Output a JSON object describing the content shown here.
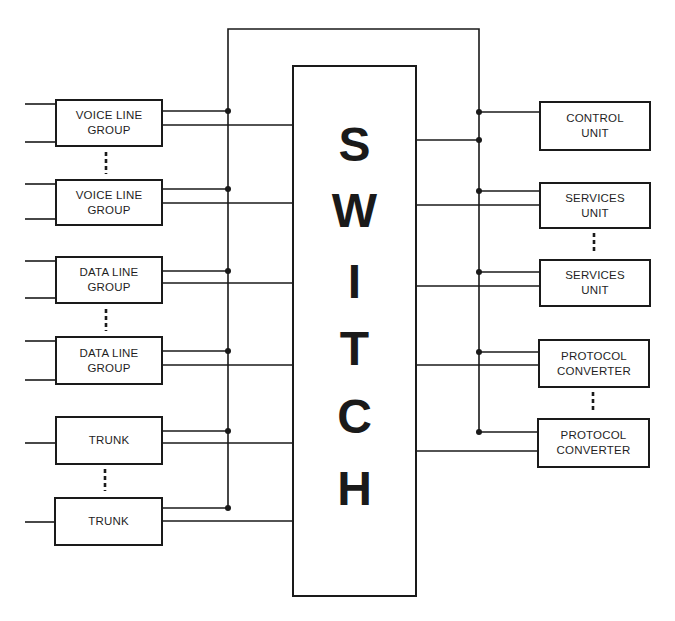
{
  "diagram": {
    "switch": {
      "label": "SWITCH",
      "letters": [
        "S",
        "W",
        "I",
        "T",
        "C",
        "H"
      ]
    },
    "left_blocks": [
      {
        "id": "voice-line-group-1",
        "label": "VOICE LINE\nGROUP"
      },
      {
        "id": "voice-line-group-2",
        "label": "VOICE LINE\nGROUP"
      },
      {
        "id": "data-line-group-1",
        "label": "DATA LINE\nGROUP"
      },
      {
        "id": "data-line-group-2",
        "label": "DATA LINE\nGROUP"
      },
      {
        "id": "trunk-1",
        "label": "TRUNK"
      },
      {
        "id": "trunk-2",
        "label": "TRUNK"
      }
    ],
    "right_blocks": [
      {
        "id": "control-unit",
        "label": "CONTROL\nUNIT"
      },
      {
        "id": "services-unit-1",
        "label": "SERVICES\nUNIT"
      },
      {
        "id": "services-unit-2",
        "label": "SERVICES\nUNIT"
      },
      {
        "id": "protocol-converter-1",
        "label": "PROTOCOL\nCONVERTER"
      },
      {
        "id": "protocol-converter-2",
        "label": "PROTOCOL\nCONVERTER"
      }
    ],
    "ellipsis_between": [
      [
        "voice-line-group-1",
        "voice-line-group-2"
      ],
      [
        "data-line-group-1",
        "data-line-group-2"
      ],
      [
        "trunk-1",
        "trunk-2"
      ],
      [
        "services-unit-1",
        "services-unit-2"
      ],
      [
        "protocol-converter-1",
        "protocol-converter-2"
      ]
    ],
    "colors": {
      "line": "#1a1a1a",
      "background": "#ffffff"
    }
  }
}
